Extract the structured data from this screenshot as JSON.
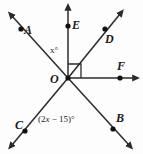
{
  "figure": {
    "type": "geometry-diagram",
    "width": 143,
    "height": 154,
    "background_color": "#fdfdfd",
    "stroke_color": "#2b2b2b"
  },
  "points": {
    "vertex": {
      "label": "O",
      "name": "point-o"
    },
    "a": {
      "label": "A",
      "name": "point-a"
    },
    "b": {
      "label": "B",
      "name": "point-b"
    },
    "c": {
      "label": "C",
      "name": "point-c"
    },
    "d": {
      "label": "D",
      "name": "point-d"
    },
    "e": {
      "label": "E",
      "name": "point-e"
    },
    "f": {
      "label": "F",
      "name": "point-f"
    }
  },
  "angles": {
    "upper_left": {
      "text": "x°",
      "variable": "x",
      "unit": "°"
    },
    "lower_left": {
      "prefix": "(2",
      "variable": "x",
      "suffix": " − 15)°"
    }
  },
  "markers": {
    "right_angle": {
      "name": "right-angle-mark",
      "between": "OE and OD",
      "value": "90°"
    }
  },
  "rays": [
    {
      "name": "ray-oa",
      "from": "O",
      "to": "A",
      "arrow": true
    },
    {
      "name": "ray-ob",
      "from": "O",
      "to": "B",
      "arrow": true
    },
    {
      "name": "ray-oc",
      "from": "O",
      "to": "C",
      "arrow": true
    },
    {
      "name": "ray-od",
      "from": "O",
      "to": "D",
      "arrow": true
    },
    {
      "name": "ray-oe",
      "from": "O",
      "to": "E",
      "arrow": true
    },
    {
      "name": "ray-of",
      "from": "O",
      "to": "F",
      "arrow": true
    }
  ]
}
